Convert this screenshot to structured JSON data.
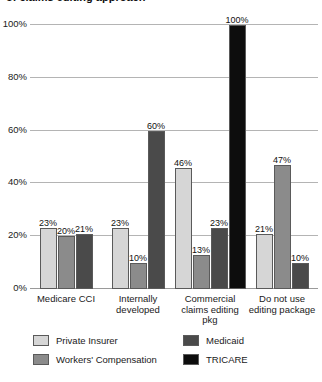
{
  "title_sliver": "of claims editing approach",
  "chart_data": {
    "type": "bar",
    "title": "",
    "xlabel": "",
    "ylabel": "",
    "ylim": [
      0,
      100
    ],
    "ytick_labels": [
      "0%",
      "20%",
      "40%",
      "60%",
      "80%",
      "100%"
    ],
    "ytick_values": [
      0,
      20,
      40,
      60,
      80,
      100
    ],
    "grid": true,
    "legend_position": "bottom",
    "categories": [
      "Medicare CCI",
      "Internally developed",
      "Commercial claims editing pkg",
      "Do not use editing package"
    ],
    "series": [
      {
        "name": "Private Insurer",
        "color": "#d6d6d6",
        "values": [
          23,
          23,
          46,
          21
        ],
        "labels": [
          "23%",
          "23%",
          "46%",
          "21%"
        ]
      },
      {
        "name": "Workers' Compensation",
        "color": "#8b8b8b",
        "values": [
          20,
          10,
          13,
          47
        ],
        "labels": [
          "20%",
          "10%",
          "13%",
          "47%"
        ]
      },
      {
        "name": "Medicaid",
        "color": "#4a4a4a",
        "values": [
          21,
          60,
          23,
          10
        ],
        "labels": [
          "21%",
          "60%",
          "23%",
          "10%"
        ]
      },
      {
        "name": "TRICARE",
        "color": "#0d0d0d",
        "values": [
          null,
          null,
          100,
          null
        ],
        "labels": [
          "",
          "",
          "100%",
          ""
        ]
      }
    ]
  }
}
